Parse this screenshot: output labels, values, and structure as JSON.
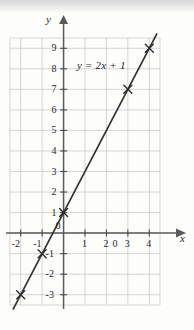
{
  "figure": {
    "background_color": "#fdfdfc",
    "grid_color": "#c9c9c9",
    "axis_color": "#555555",
    "line_color": "#333333",
    "text_color": "#262626"
  },
  "axis_labels": {
    "x": "x",
    "y": "y"
  },
  "annotation": {
    "equation": "y = 2x + 1"
  },
  "chart_data": {
    "type": "line",
    "title": "",
    "subtitle": "",
    "xlabel": "x",
    "ylabel": "y",
    "equation": "y = 2x + 1",
    "slope": 2,
    "intercept": 1,
    "xlim": [
      -2.5,
      4.5
    ],
    "ylim": [
      -3.5,
      9.5
    ],
    "grid": true,
    "grid_step_x": 1,
    "grid_step_y": 1,
    "legend": false,
    "legend_position": "none",
    "annotations": [
      {
        "text": "y = 2x + 1",
        "x": 1.1,
        "y": 8.3
      }
    ],
    "xticks": [
      -2,
      -1,
      1,
      2,
      3,
      4
    ],
    "xtick_labels": [
      "-2",
      "-1",
      "1",
      "2",
      "3",
      "4"
    ],
    "yticks": [
      9,
      8,
      7,
      6,
      5,
      4,
      3,
      2,
      1,
      -1,
      -2,
      -3
    ],
    "ytick_labels": [
      "9",
      "8",
      "7",
      "6",
      "5",
      "4",
      "3",
      "2",
      "1",
      "-1",
      "-2",
      "-3"
    ],
    "origin_label": "0",
    "stray_origin_label": "0",
    "series": [
      {
        "name": "y = 2x + 1",
        "marker": "x",
        "x": [
          -2,
          -1,
          0,
          3,
          4
        ],
        "values": [
          -3,
          -1,
          1,
          7,
          9
        ]
      }
    ],
    "line_endpoints": {
      "x": [
        -2.35,
        4.35
      ],
      "y": [
        -3.7,
        9.7
      ]
    }
  }
}
